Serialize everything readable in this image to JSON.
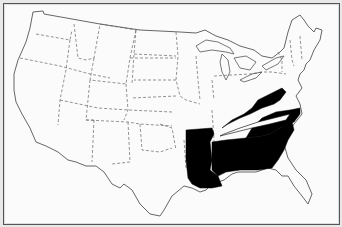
{
  "map": {
    "title": "United States map with highlighted states",
    "projection": "contiguous-us-outline",
    "colors": {
      "background": "#fbfbfb",
      "highlight": "#000000",
      "border": "#555555",
      "state_line": "#666666"
    },
    "highlighted_states": [
      "Kentucky",
      "Arkansas",
      "Louisiana",
      "Mississippi",
      "Alabama",
      "Georgia",
      "South Carolina",
      "North Carolina"
    ],
    "outlined_unhighlighted_neighbor": "Tennessee",
    "labels": []
  }
}
